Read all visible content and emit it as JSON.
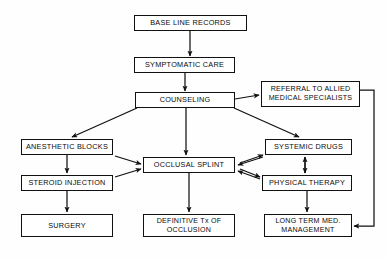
{
  "diagram": {
    "background_color": "#fefefe",
    "line_color": "#111111",
    "text_color": "#0a0a0a",
    "nodes": [
      {
        "id": "base_line_records",
        "label": "BASE LINE RECORDS",
        "x": 134,
        "y": 15,
        "w": 113,
        "h": 16
      },
      {
        "id": "symptomatic_care",
        "label": "SYMPTOMATIC CARE",
        "x": 134,
        "y": 57,
        "w": 101,
        "h": 16
      },
      {
        "id": "counseling",
        "label": "COUNSELING",
        "x": 135,
        "y": 92,
        "w": 100,
        "h": 16
      },
      {
        "id": "referral_allied",
        "label": "REFERRAL TO ALLIED\nMEDICAL SPECIALISTS",
        "x": 261,
        "y": 81,
        "w": 99,
        "h": 26
      },
      {
        "id": "anesthetic_blocks",
        "label": "ANESTHETIC BLOCKS",
        "x": 21,
        "y": 139,
        "w": 92,
        "h": 16
      },
      {
        "id": "occlusal_splint",
        "label": "OCCLUSAL SPLINT",
        "x": 143,
        "y": 157,
        "w": 92,
        "h": 16
      },
      {
        "id": "systemic_drugs",
        "label": "SYSTEMIC DRUGS",
        "x": 265,
        "y": 139,
        "w": 87,
        "h": 16
      },
      {
        "id": "steroid_injection",
        "label": "STEROID INJECTION",
        "x": 21,
        "y": 175,
        "w": 92,
        "h": 16
      },
      {
        "id": "physical_therapy",
        "label": "PHYSICAL THERAPY",
        "x": 262,
        "y": 175,
        "w": 90,
        "h": 16
      },
      {
        "id": "surgery",
        "label": "SURGERY",
        "x": 21,
        "y": 214,
        "w": 92,
        "h": 23
      },
      {
        "id": "definitive_tx",
        "label": "DEFINITIVE Tx OF\nOCCLUSION",
        "x": 143,
        "y": 214,
        "w": 92,
        "h": 23
      },
      {
        "id": "long_term_mgmt",
        "label": "LONG TERM MED.\nMANAGEMENT",
        "x": 264,
        "y": 214,
        "w": 88,
        "h": 23
      }
    ],
    "edges": [
      {
        "id": "baseline-to-symptomatic",
        "from": "base_line_records",
        "to": "symptomatic_care",
        "type": "straight-down"
      },
      {
        "id": "symptomatic-to-counseling",
        "from": "symptomatic_care",
        "to": "counseling",
        "type": "straight-down"
      },
      {
        "id": "counseling-to-referral",
        "from": "counseling",
        "to": "referral_allied",
        "type": "right-arrow"
      },
      {
        "id": "counseling-to-anesthetic",
        "from": "counseling",
        "to": "anesthetic_blocks",
        "type": "diagonal-left"
      },
      {
        "id": "counseling-to-splint",
        "from": "counseling",
        "to": "occlusal_splint",
        "type": "straight-down"
      },
      {
        "id": "counseling-to-systemic",
        "from": "counseling",
        "to": "systemic_drugs",
        "type": "diagonal-right"
      },
      {
        "id": "anesthetic-to-steroid",
        "from": "anesthetic_blocks",
        "to": "steroid_injection",
        "type": "straight-down"
      },
      {
        "id": "anesthetic-to-splint",
        "from": "anesthetic_blocks",
        "to": "occlusal_splint",
        "type": "diagonal-right"
      },
      {
        "id": "steroid-to-splint",
        "from": "steroid_injection",
        "to": "occlusal_splint",
        "type": "diagonal-right"
      },
      {
        "id": "steroid-to-surgery",
        "from": "steroid_injection",
        "to": "surgery",
        "type": "straight-down"
      },
      {
        "id": "splint-to-definitive",
        "from": "occlusal_splint",
        "to": "definitive_tx",
        "type": "straight-down"
      },
      {
        "id": "splint-systemic-both",
        "from": "occlusal_splint",
        "to": "systemic_drugs",
        "type": "bidirectional"
      },
      {
        "id": "splint-physical-both",
        "from": "occlusal_splint",
        "to": "physical_therapy",
        "type": "bidirectional"
      },
      {
        "id": "systemic-physical-both",
        "from": "systemic_drugs",
        "to": "physical_therapy",
        "type": "bidirectional-vertical"
      },
      {
        "id": "physical-to-longterm",
        "from": "physical_therapy",
        "to": "long_term_mgmt",
        "type": "straight-down"
      },
      {
        "id": "referral-to-longterm",
        "from": "referral_allied",
        "to": "long_term_mgmt",
        "type": "right-routed"
      }
    ]
  }
}
